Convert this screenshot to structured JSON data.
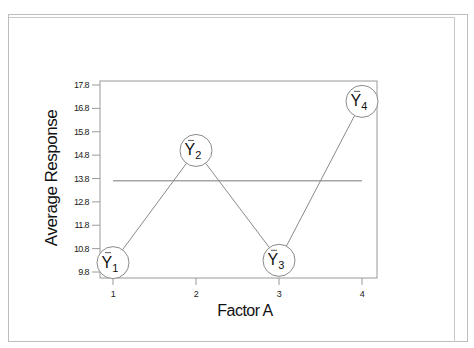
{
  "chart_data": {
    "type": "line",
    "title": "",
    "xlabel": "Factor A",
    "ylabel": "Average Response",
    "categories": [
      "1",
      "2",
      "3",
      "4"
    ],
    "x": [
      1,
      2,
      3,
      4
    ],
    "series": [
      {
        "name": "Average Response",
        "values": [
          10.2,
          15.0,
          10.3,
          17.1
        ],
        "point_labels": [
          "Y1",
          "Y2",
          "Y3",
          "Y4"
        ]
      }
    ],
    "reference_lines": [
      {
        "name": "grand mean",
        "y": 13.7,
        "x_from": 1,
        "x_to": 4
      }
    ],
    "y_ticks": [
      9.8,
      10.8,
      11.8,
      12.8,
      13.8,
      14.8,
      15.8,
      16.8,
      17.8
    ],
    "y_tick_labels": [
      "9.8",
      "10.8",
      "11.8",
      "12.8",
      "13.8",
      "14.8",
      "15.8",
      "16.8",
      "17.8"
    ],
    "x_tick_labels": [
      "1",
      "2",
      "3",
      "4"
    ],
    "ylim": [
      9.5,
      17.95
    ],
    "xlim": [
      0.85,
      4.2
    ],
    "grid": false,
    "legend": "none"
  },
  "labels": {
    "xlabel": "Factor A",
    "ylabel": "Average Response",
    "points": [
      {
        "base": "Y",
        "sub": "1"
      },
      {
        "base": "Y",
        "sub": "2"
      },
      {
        "base": "Y",
        "sub": "3"
      },
      {
        "base": "Y",
        "sub": "4"
      }
    ]
  },
  "colors": {
    "line": "#8a8a8a",
    "frame": "#9a9a9a",
    "text": "#111111"
  }
}
